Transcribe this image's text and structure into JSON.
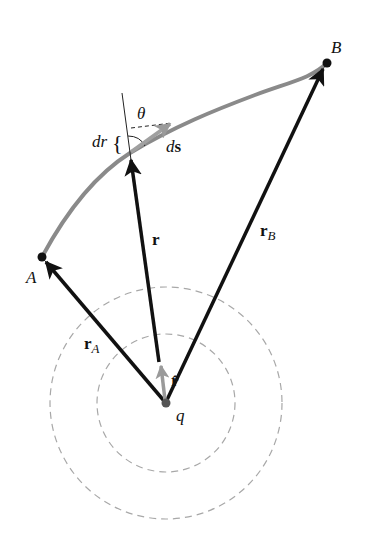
{
  "diagram": {
    "colors": {
      "background": "#ffffff",
      "vector": "#111111",
      "path": "#8a8a8a",
      "unit_vector": "#9a9a9a",
      "equipotential": "#a8a8a8",
      "charge": "#555555"
    },
    "points": {
      "A": {
        "label": "A",
        "x": 42,
        "y": 257
      },
      "B": {
        "label": "B",
        "x": 327,
        "y": 63
      },
      "q": {
        "label": "q",
        "x": 165,
        "y": 403
      }
    },
    "vectors": {
      "rA": {
        "label_main": "r",
        "label_sub": "A"
      },
      "rB": {
        "label_main": "r",
        "label_sub": "B"
      },
      "r": {
        "label": "r"
      },
      "rhat": {
        "label": "r̂"
      },
      "ds": {
        "label_d": "d",
        "label_s": "s"
      }
    },
    "annotations": {
      "theta": "θ",
      "dr": "dr",
      "brace": "{"
    },
    "equipotentials": [
      {
        "r": 69
      },
      {
        "r": 116
      }
    ]
  }
}
